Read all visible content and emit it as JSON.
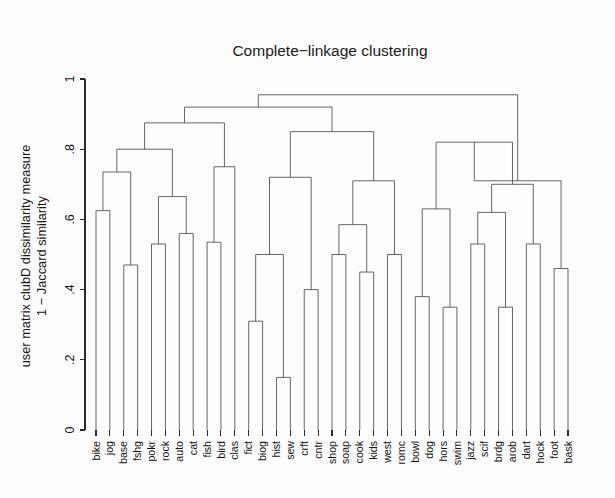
{
  "figure": {
    "title": "Complete−linkage clustering",
    "background_color": "#fdfdfd",
    "line_color": "#555555",
    "axis_color": "#2b2b2b",
    "text_color": "#141414"
  },
  "chart_data": {
    "type": "dendrogram",
    "title": "Complete−linkage clustering",
    "xlabel": "",
    "ylabel": "user matrix clubD dissimilarity measure\n1 − Jaccard similarity",
    "ylabel_line1": "user matrix clubD dissimilarity measure",
    "ylabel_line2": "1 − Jaccard similarity",
    "ylim": [
      0,
      1
    ],
    "yticks": [
      0,
      0.2,
      0.4,
      0.6,
      0.8,
      1
    ],
    "ytick_labels": [
      "0",
      ".2",
      ".4",
      ".6",
      ".8",
      "1"
    ],
    "grid": false,
    "legend": null,
    "linkage_method": "complete",
    "distance_metric": "1 - Jaccard similarity",
    "n_leaves": 35,
    "leaf_order": [
      "bike",
      "jog",
      "base",
      "fshg",
      "pokr",
      "rock",
      "auto",
      "cat",
      "fish",
      "bird",
      "clas",
      "fict",
      "biog",
      "hist",
      "sew",
      "crft",
      "cntr",
      "shop",
      "soap",
      "cook",
      "kids",
      "west",
      "romc",
      "bowl",
      "dog",
      "hors",
      "swim",
      "jazz",
      "scif",
      "brdg",
      "arob",
      "dart",
      "hock",
      "foot",
      "bask"
    ],
    "merges": [
      {
        "id": "m1",
        "left": "bike",
        "right": "jog",
        "height": 0.625
      },
      {
        "id": "m2",
        "left": "base",
        "right": "fshg",
        "height": 0.47
      },
      {
        "id": "m3",
        "left": "m1",
        "right": "m2",
        "height": 0.735
      },
      {
        "id": "m4",
        "left": "pokr",
        "right": "rock",
        "height": 0.53
      },
      {
        "id": "m5",
        "left": "auto",
        "right": "cat",
        "height": 0.56
      },
      {
        "id": "m6",
        "left": "m4",
        "right": "m5",
        "height": 0.665
      },
      {
        "id": "m7",
        "left": "m3",
        "right": "m6",
        "height": 0.8
      },
      {
        "id": "m8",
        "left": "fish",
        "right": "bird",
        "height": 0.535
      },
      {
        "id": "m9",
        "left": "m8",
        "right": "clas",
        "height": 0.75
      },
      {
        "id": "m10",
        "left": "m7",
        "right": "m9",
        "height": 0.875
      },
      {
        "id": "m11",
        "left": "fict",
        "right": "biog",
        "height": 0.31
      },
      {
        "id": "m12",
        "left": "hist",
        "right": "sew",
        "height": 0.15
      },
      {
        "id": "m13",
        "left": "m11",
        "right": "m12",
        "height": 0.5
      },
      {
        "id": "m14",
        "left": "crft",
        "right": "cntr",
        "height": 0.4
      },
      {
        "id": "m15",
        "left": "m13",
        "right": "m14",
        "height": 0.72
      },
      {
        "id": "m16",
        "left": "shop",
        "right": "soap",
        "height": 0.5
      },
      {
        "id": "m17",
        "left": "cook",
        "right": "kids",
        "height": 0.45
      },
      {
        "id": "m18",
        "left": "m16",
        "right": "m17",
        "height": 0.585
      },
      {
        "id": "m19",
        "left": "west",
        "right": "romc",
        "height": 0.5
      },
      {
        "id": "m20",
        "left": "m18",
        "right": "m19",
        "height": 0.71
      },
      {
        "id": "m21",
        "left": "m15",
        "right": "m20",
        "height": 0.85
      },
      {
        "id": "m22",
        "left": "m10",
        "right": "m21",
        "height": 0.92
      },
      {
        "id": "m23",
        "left": "bowl",
        "right": "dog",
        "height": 0.38
      },
      {
        "id": "m24",
        "left": "hors",
        "right": "swim",
        "height": 0.35
      },
      {
        "id": "m25",
        "left": "m23",
        "right": "m24",
        "height": 0.63
      },
      {
        "id": "m26",
        "left": "jazz",
        "right": "scif",
        "height": 0.53
      },
      {
        "id": "m27",
        "left": "brdg",
        "right": "arob",
        "height": 0.35
      },
      {
        "id": "m28",
        "left": "m26",
        "right": "m27",
        "height": 0.62
      },
      {
        "id": "m29",
        "left": "dart",
        "right": "hock",
        "height": 0.53
      },
      {
        "id": "m30",
        "left": "m28",
        "right": "m29",
        "height": 0.7
      },
      {
        "id": "m31",
        "left": "m25",
        "right": "m30",
        "height": 0.82
      },
      {
        "id": "m32",
        "left": "foot",
        "right": "bask",
        "height": 0.46
      },
      {
        "id": "m33",
        "left": "m31",
        "right": "m32",
        "height": 0.71
      },
      {
        "id": "m34",
        "left": "m22",
        "right": "m33",
        "height": 0.955
      }
    ]
  }
}
